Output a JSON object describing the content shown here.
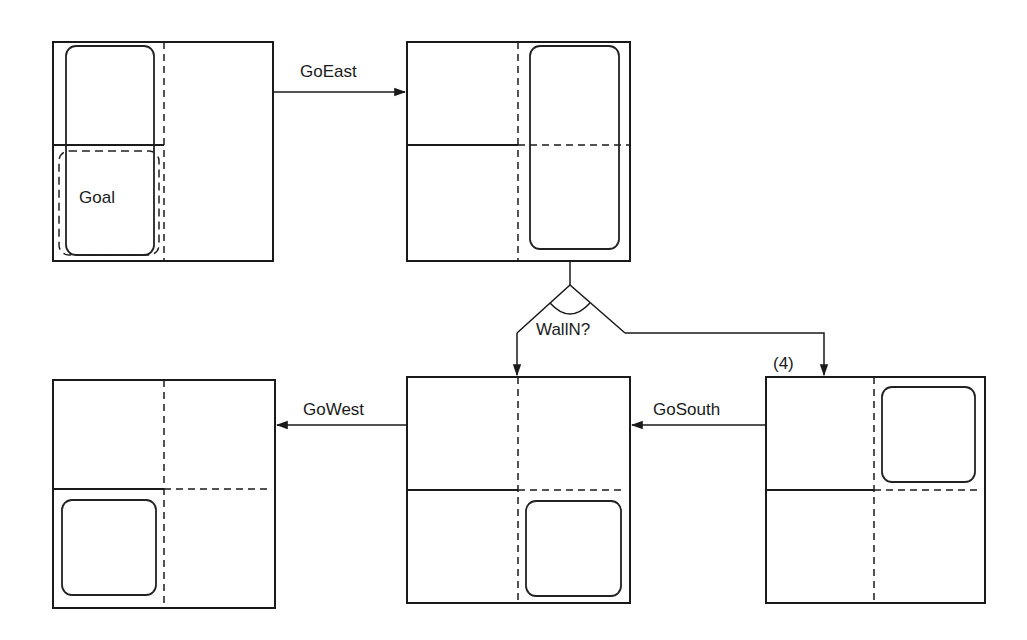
{
  "diagram": {
    "title": "",
    "states": [
      {
        "id": "s1",
        "name": "initial-state",
        "region": "west column (NW + SW)",
        "goal_label": "Goal",
        "goal_region": "SW cell"
      },
      {
        "id": "s2",
        "name": "after-goeast",
        "region": "east column (NE + SE)"
      },
      {
        "id": "s3",
        "name": "after-gowest",
        "region": "SW cell"
      },
      {
        "id": "s4",
        "name": "after-gosouth",
        "region": "SE cell"
      },
      {
        "id": "s5",
        "name": "wall-north-branch",
        "region": "NE cell"
      }
    ],
    "actions": {
      "go_east": "GoEast",
      "go_west": "GoWest",
      "go_south": "GoSouth"
    },
    "decision": {
      "label": "WallN?",
      "branch_marker": "(4)"
    },
    "edges": [
      {
        "from": "s1",
        "to": "s2",
        "label": "GoEast"
      },
      {
        "from": "s2",
        "to": "decision",
        "label": ""
      },
      {
        "from": "decision",
        "to": "s4",
        "label": ""
      },
      {
        "from": "decision",
        "to": "s5",
        "label": "(4)"
      },
      {
        "from": "s5",
        "to": "s4",
        "label": "GoSouth"
      },
      {
        "from": "s4",
        "to": "s3",
        "label": "GoWest"
      }
    ],
    "colors": {
      "stroke": "#1a1a1a",
      "background": "#ffffff"
    }
  }
}
